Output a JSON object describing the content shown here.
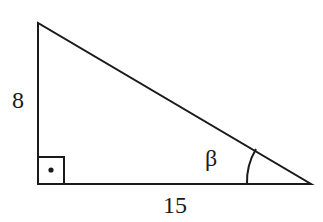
{
  "figure": {
    "type": "right-triangle",
    "partial_label": ")",
    "legs": {
      "vertical": {
        "label": "8"
      },
      "horizontal": {
        "label": "15"
      }
    },
    "angle": {
      "label": "β"
    },
    "right_angle_marker": "square-with-dot"
  },
  "colors": {
    "stroke": "#1a1a1a",
    "background": "#ffffff"
  }
}
